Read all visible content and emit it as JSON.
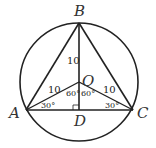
{
  "diagram": {
    "type": "geometry",
    "points": {
      "A": {
        "label": "A",
        "x": 26,
        "y": 110
      },
      "B": {
        "label": "B",
        "x": 79,
        "y": 23
      },
      "C": {
        "label": "C",
        "x": 133,
        "y": 110
      },
      "O": {
        "label": "O",
        "x": 79,
        "y": 82
      },
      "D": {
        "label": "D",
        "x": 79,
        "y": 110
      }
    },
    "circle": {
      "cx": 79,
      "cy": 82,
      "r": 59
    },
    "lengths": {
      "OB": "10",
      "OA": "10",
      "OC": "10"
    },
    "angles": {
      "OAD": "30°",
      "OCD": "30°",
      "AOD": "60°",
      "COD": "60°"
    },
    "right_angle_at": "D",
    "stroke_color": "#222222"
  }
}
